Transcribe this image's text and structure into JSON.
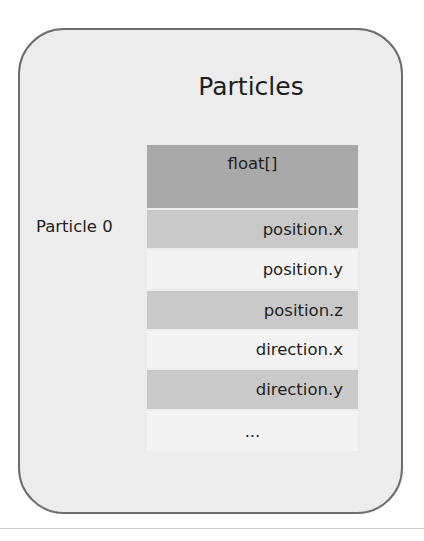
{
  "diagram": {
    "title": "Particles",
    "row_label": "Particle 0",
    "table": {
      "header": "float[]",
      "rows": [
        {
          "label": "position.x",
          "shade": "dark"
        },
        {
          "label": "position.y",
          "shade": "light"
        },
        {
          "label": "position.z",
          "shade": "dark"
        },
        {
          "label": "direction.x",
          "shade": "light"
        },
        {
          "label": "direction.y",
          "shade": "dark"
        },
        {
          "label": "...",
          "shade": "light"
        }
      ]
    },
    "colors": {
      "outer_fill": "#ececec",
      "outer_border": "#6e6e6e",
      "header_fill": "#a9a9a9",
      "dark_row": "#c9c9c9",
      "light_row": "#f3f3f3"
    }
  }
}
